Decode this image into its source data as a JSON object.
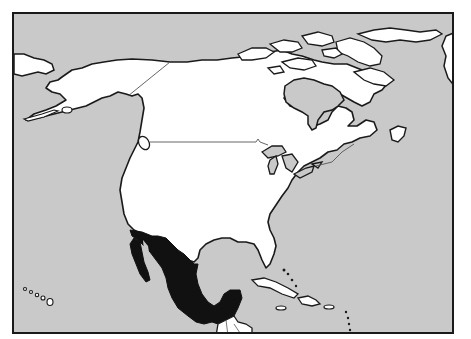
{
  "map": {
    "title": "",
    "region": "North America",
    "highlighted_country": "Mexico",
    "colors": {
      "ocean": "#c9c9c9",
      "land": "#ffffff",
      "highlight": "#111111",
      "coastline": "#1a1a1a",
      "border": "#555555",
      "lakes": "#c9c9c9"
    },
    "features": [
      {
        "name": "Canada",
        "fill": "land"
      },
      {
        "name": "United States",
        "fill": "land"
      },
      {
        "name": "Alaska",
        "fill": "land"
      },
      {
        "name": "Mexico",
        "fill": "highlight"
      },
      {
        "name": "Greenland",
        "fill": "land"
      },
      {
        "name": "Central America",
        "fill": "land"
      },
      {
        "name": "Cuba",
        "fill": "land"
      },
      {
        "name": "Hispaniola",
        "fill": "land"
      },
      {
        "name": "Hawaii",
        "fill": "land"
      },
      {
        "name": "Great Lakes",
        "fill": "lakes"
      },
      {
        "name": "Hudson Bay",
        "fill": "lakes"
      }
    ]
  }
}
